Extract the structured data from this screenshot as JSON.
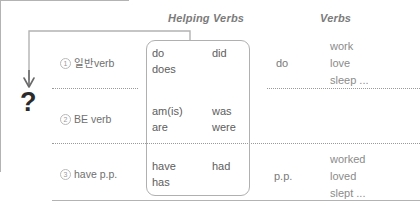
{
  "headers": {
    "helping_verbs": "Helping Verbs",
    "verbs": "Verbs"
  },
  "rows": [
    {
      "number": "1",
      "label": "일반verb",
      "helping_left": [
        "do",
        "does"
      ],
      "helping_right": [
        "did"
      ],
      "middle": "do",
      "verbs": [
        "work",
        "love",
        "sleep ..."
      ]
    },
    {
      "number": "2",
      "label": "BE verb",
      "helping_left": [
        "am(is)",
        "are"
      ],
      "helping_right": [
        "was",
        "were"
      ],
      "middle": "",
      "verbs": []
    },
    {
      "number": "3",
      "label": "have p.p.",
      "helping_left": [
        "have",
        "has"
      ],
      "helping_right": [
        "had"
      ],
      "middle": "p.p.",
      "verbs": [
        "worked",
        "loved",
        "slept ..."
      ]
    }
  ],
  "annotation": {
    "question_mark": "?",
    "arrow_icon": "down-arrow-icon"
  },
  "colors": {
    "text_dark": "#2b2b2b",
    "text_gray": "#7a7a7a",
    "rule_gray": "#b3b3b3",
    "box_border": "#b0b0b0"
  }
}
